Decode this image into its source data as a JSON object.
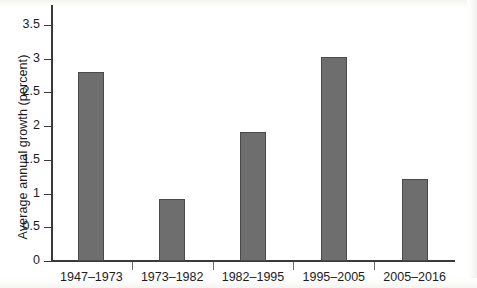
{
  "chart_data": {
    "type": "bar",
    "title": "",
    "xlabel": "",
    "ylabel": "Average annual growth (percent)",
    "categories": [
      "1947–1973",
      "1973–1982",
      "1982–1995",
      "1995–2005",
      "2005–2016"
    ],
    "values": [
      2.8,
      0.92,
      1.91,
      3.03,
      1.22
    ],
    "ylim": [
      0,
      3.75
    ],
    "yticks": [
      0,
      0.5,
      1,
      1.5,
      2,
      2.5,
      3,
      3.5
    ],
    "ytick_labels": [
      "0",
      "0.5",
      "1",
      "1.5",
      "2",
      "2.5",
      "3",
      "3.5"
    ],
    "grid": false,
    "legend": null,
    "bar_color": "#6e6e6e",
    "bar_edge_color": "#4a4a4a",
    "axis_color": "#3a3a3a",
    "background_color": "#ffffff"
  }
}
